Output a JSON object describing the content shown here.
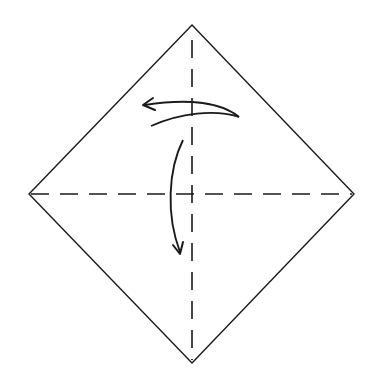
{
  "diagram": {
    "type": "origami-fold-instruction",
    "colors": {
      "background": "#ffffff",
      "stroke": "#1a1a1a"
    },
    "paper": {
      "shape": "diamond",
      "vertices": {
        "top": [
          192,
          25
        ],
        "right": [
          354,
          194
        ],
        "bottom": [
          192,
          363
        ],
        "left": [
          29,
          194
        ]
      }
    },
    "creases": [
      {
        "name": "vertical-diagonal",
        "style": "dashed",
        "from": [
          192,
          25
        ],
        "to": [
          192,
          363
        ]
      },
      {
        "name": "horizontal-diagonal",
        "style": "dashed",
        "from": [
          29,
          194
        ],
        "to": [
          354,
          194
        ]
      }
    ],
    "arrows": [
      {
        "name": "fold-left-arrow",
        "direction": "left",
        "description": "Curved arrow from upper right sweeping to the left above the center"
      },
      {
        "name": "fold-down-arrow",
        "direction": "down",
        "description": "Curved arrow on the left of center sweeping downward"
      }
    ]
  }
}
